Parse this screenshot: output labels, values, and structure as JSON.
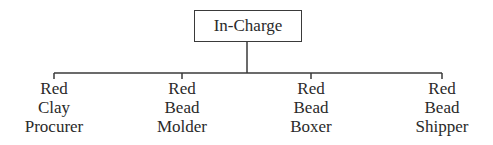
{
  "root": {
    "label": "In-Charge"
  },
  "children": [
    {
      "lines": [
        "Red",
        "Clay",
        "Procurer"
      ]
    },
    {
      "lines": [
        "Red",
        "Bead",
        "Molder"
      ]
    },
    {
      "lines": [
        "Red",
        "Bead",
        "Boxer"
      ]
    },
    {
      "lines": [
        "Red",
        "Bead",
        "Shipper"
      ]
    }
  ],
  "colors": {
    "line": "#3a3a3a",
    "text": "#2a2a2a",
    "background": "#ffffff"
  }
}
